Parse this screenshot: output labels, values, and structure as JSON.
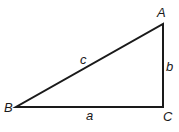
{
  "diagram": {
    "type": "right-triangle",
    "vertices": {
      "A": {
        "label": "A",
        "x": 163,
        "y": 24
      },
      "B": {
        "label": "B",
        "x": 16,
        "y": 107
      },
      "C": {
        "label": "C",
        "x": 163,
        "y": 107
      }
    },
    "sides": {
      "a": {
        "label": "a",
        "from": "B",
        "to": "C"
      },
      "b": {
        "label": "b",
        "from": "C",
        "to": "A"
      },
      "c": {
        "label": "c",
        "from": "B",
        "to": "A"
      }
    },
    "colors": {
      "stroke": "#1a1a1a",
      "background": "#ffffff"
    }
  }
}
